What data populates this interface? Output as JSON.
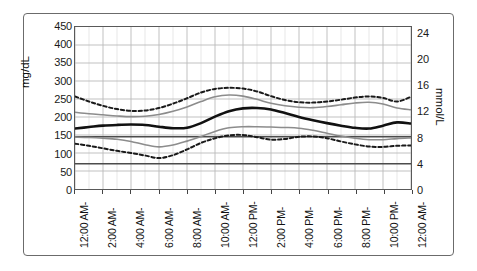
{
  "chart_data": {
    "type": "line",
    "title": "",
    "subtitle": "",
    "xlabel": "",
    "ylabel": "mg/dL",
    "ylabel_right": "mmol/L",
    "grid": true,
    "legend_position": "none",
    "x_tick_labels": [
      "12:00 AM-",
      "2:00 AM-",
      "4:00 AM-",
      "6:00 AM-",
      "8:00 AM-",
      "10:00 AM-",
      "12:00 PM-",
      "2:00 PM-",
      "4:00 PM-",
      "6:00 PM-",
      "8:00 PM-",
      "10:00 PM-",
      "12:00 AM-"
    ],
    "x_tick_hours": [
      0,
      2,
      4,
      6,
      8,
      10,
      12,
      14,
      16,
      18,
      20,
      22,
      24
    ],
    "xlim": [
      0,
      24
    ],
    "y_tick_labels_left": [
      "450",
      "400",
      "350",
      "300",
      "250",
      "200",
      "150",
      "100",
      "50",
      "0"
    ],
    "y_tick_values_left": [
      450,
      400,
      350,
      300,
      250,
      200,
      150,
      100,
      50,
      0
    ],
    "ylim": [
      0,
      450
    ],
    "y_tick_labels_right": [
      "24",
      "20",
      "16",
      "12",
      "8",
      "4",
      "0"
    ],
    "y_tick_values_right": [
      24,
      20,
      16,
      12,
      8,
      4,
      0
    ],
    "ylim_right": [
      0,
      25
    ],
    "x": [
      0,
      1,
      2,
      3,
      4,
      5,
      6,
      7,
      8,
      9,
      10,
      11,
      12,
      13,
      14,
      15,
      16,
      17,
      18,
      19,
      20,
      21,
      22,
      23,
      24
    ],
    "series": [
      {
        "name": "Upper limit (dashed)",
        "style": "dashed",
        "color": "#1a1a1a",
        "width": 2.0,
        "values": [
          257,
          243,
          231,
          222,
          217,
          218,
          225,
          237,
          252,
          268,
          278,
          281,
          279,
          271,
          258,
          247,
          241,
          240,
          243,
          248,
          254,
          257,
          253,
          243,
          256
        ]
      },
      {
        "name": "75th percentile",
        "style": "solid",
        "color": "#8c8c8c",
        "width": 1.6,
        "values": [
          213,
          209,
          206,
          203,
          201,
          202,
          207,
          216,
          228,
          243,
          256,
          261,
          258,
          249,
          238,
          231,
          227,
          226,
          229,
          234,
          239,
          241,
          236,
          225,
          220
        ]
      },
      {
        "name": "Median",
        "style": "solid",
        "color": "#111111",
        "width": 2.6,
        "values": [
          168,
          172,
          176,
          178,
          179,
          178,
          173,
          169,
          170,
          183,
          201,
          216,
          224,
          225,
          221,
          211,
          200,
          191,
          183,
          176,
          170,
          168,
          176,
          185,
          182
        ]
      },
      {
        "name": "25th percentile",
        "style": "solid",
        "color": "#8c8c8c",
        "width": 1.6,
        "values": [
          144,
          143,
          141,
          138,
          132,
          123,
          117,
          122,
          133,
          146,
          160,
          170,
          173,
          173,
          172,
          171,
          169,
          163,
          155,
          147,
          141,
          137,
          137,
          140,
          142
        ]
      },
      {
        "name": "Lower limit (dashed)",
        "style": "dashed",
        "color": "#1a1a1a",
        "width": 2.0,
        "values": [
          126,
          120,
          113,
          106,
          100,
          93,
          86,
          94,
          110,
          128,
          141,
          149,
          150,
          144,
          137,
          139,
          145,
          146,
          141,
          132,
          124,
          118,
          117,
          120,
          121
        ]
      }
    ],
    "reference_lines": [
      {
        "name": "upper-target-line",
        "value": 145,
        "color": "#4c4c4c",
        "width": 1.4,
        "style": "solid"
      },
      {
        "name": "lower-target-line",
        "value": 70,
        "color": "#4c4c4c",
        "width": 1.4,
        "style": "solid"
      }
    ]
  }
}
